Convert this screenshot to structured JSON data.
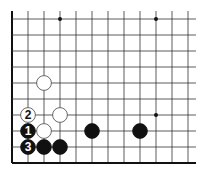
{
  "diagram": {
    "type": "go-board-fragment",
    "grid": {
      "origin_x": 12,
      "bottom_y": 163,
      "spacing": 16,
      "columns": 12,
      "rows": 10,
      "top_open_y": 11,
      "right_open_x": 196,
      "edges": [
        "left",
        "bottom"
      ]
    },
    "star_points": [
      {
        "col": 3,
        "row": 9
      },
      {
        "col": 9,
        "row": 9
      },
      {
        "col": 9,
        "row": 3
      }
    ],
    "stones": [
      {
        "color": "white",
        "col": 2,
        "row": 5,
        "label": ""
      },
      {
        "color": "white",
        "col": 3,
        "row": 3,
        "label": ""
      },
      {
        "color": "white",
        "col": 1,
        "row": 3,
        "label": "2"
      },
      {
        "color": "black",
        "col": 1,
        "row": 2,
        "label": "1"
      },
      {
        "color": "white",
        "col": 2,
        "row": 2,
        "label": ""
      },
      {
        "color": "black",
        "col": 1,
        "row": 1,
        "label": "3"
      },
      {
        "color": "black",
        "col": 2,
        "row": 1,
        "label": ""
      },
      {
        "color": "black",
        "col": 3,
        "row": 1,
        "label": ""
      },
      {
        "color": "black",
        "col": 5,
        "row": 2,
        "label": ""
      },
      {
        "color": "black",
        "col": 8,
        "row": 2,
        "label": ""
      }
    ],
    "colors": {
      "line": "#333333",
      "edge": "#111111",
      "black_stone": "#111111",
      "white_stone": "#ffffff",
      "white_outline": "#444444"
    }
  }
}
